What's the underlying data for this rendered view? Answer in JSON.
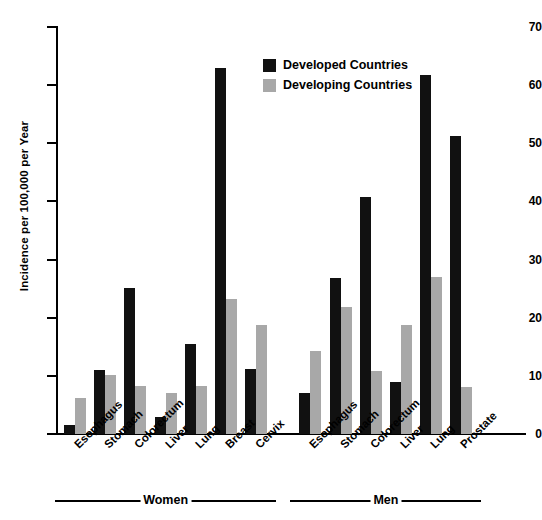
{
  "chart_data": {
    "type": "bar",
    "title": "",
    "xlabel": "",
    "ylabel": "Incidence per 100,000 per Year",
    "ylim": [
      0,
      70
    ],
    "yticks": [
      0,
      10,
      20,
      30,
      40,
      50,
      60,
      70
    ],
    "grid": false,
    "legend_position": "top-center-right",
    "categories": [
      "Esophagus",
      "Stomach",
      "Colorectum",
      "Liver",
      "Lung",
      "Breast",
      "Cervix",
      "Esophagus",
      "Stomach",
      "Colorectum",
      "Liver",
      "Lung",
      "Prostate"
    ],
    "groups": [
      {
        "label": "Women",
        "start_index": 0,
        "end_index": 6
      },
      {
        "label": "Men",
        "start_index": 7,
        "end_index": 12
      }
    ],
    "series": [
      {
        "name": "Developed Countries",
        "color": "#111111",
        "values": [
          1.6,
          11.0,
          25.1,
          3.0,
          15.4,
          63.0,
          11.2,
          7.1,
          26.8,
          40.7,
          9.0,
          61.7,
          51.2
        ]
      },
      {
        "name": "Developing Countries",
        "color": "#a8a8a8",
        "values": [
          6.2,
          10.2,
          8.2,
          7.0,
          8.2,
          23.2,
          18.8,
          14.3,
          21.8,
          10.8,
          18.8,
          27.0,
          8.1
        ]
      }
    ]
  },
  "legend": {
    "items": [
      {
        "label": "Developed Countries",
        "swatch": "dev"
      },
      {
        "label": "Developing Countries",
        "swatch": "devg"
      }
    ]
  },
  "axis": {
    "y_title": "Incidence per 100,000 per Year",
    "tick_labels": [
      "70",
      "60",
      "50",
      "40",
      "30",
      "20",
      "10",
      "0"
    ]
  },
  "title_fragment": ""
}
